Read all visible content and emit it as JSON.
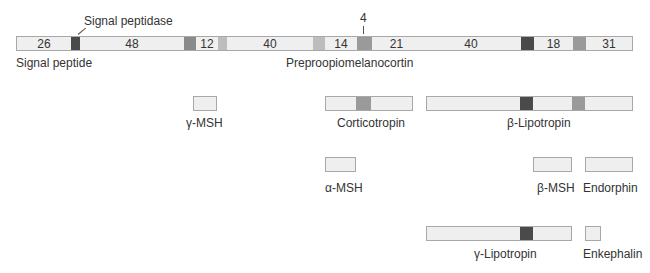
{
  "title": "Preproopiomelanocortin",
  "annotations": {
    "signal_peptidase": "Signal peptidase",
    "signal_peptide": "Signal peptide",
    "cleavage_length": "4"
  },
  "main_bar": {
    "label": "Preproopiomelanocortin",
    "segments": [
      {
        "len": "26",
        "type": "plain"
      },
      {
        "len": "",
        "type": "dark"
      },
      {
        "len": "48",
        "type": "plain"
      },
      {
        "len": "",
        "type": "mid"
      },
      {
        "len": "12",
        "type": "plain"
      },
      {
        "len": "",
        "type": "light"
      },
      {
        "len": "40",
        "type": "plain"
      },
      {
        "len": "",
        "type": "light"
      },
      {
        "len": "14",
        "type": "plain"
      },
      {
        "len": "",
        "type": "gray"
      },
      {
        "len": "21",
        "type": "plain"
      },
      {
        "len": "40",
        "type": "plain"
      },
      {
        "len": "",
        "type": "dark"
      },
      {
        "len": "18",
        "type": "plain"
      },
      {
        "len": "",
        "type": "gray"
      },
      {
        "len": "31",
        "type": "plain"
      }
    ]
  },
  "products": {
    "gamma_msh": "γ-MSH",
    "corticotropin": "Corticotropin",
    "beta_lipotropin": "β-Lipotropin",
    "alpha_msh": "α-MSH",
    "beta_msh": "β-MSH",
    "endorphin": "Endorphin",
    "gamma_lipotropin": "γ-Lipotropin",
    "enkephalin": "Enkephalin"
  },
  "colors": {
    "segment_fill": "#efefef",
    "dark_cleavage": "#4a4a4a",
    "gray_cleavage": "#9a9a9a",
    "light_cleavage": "#bdbdbd",
    "border": "#a8a8a8"
  }
}
